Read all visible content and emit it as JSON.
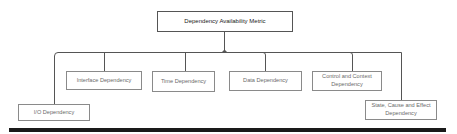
{
  "diagram": {
    "type": "hierarchy-tree",
    "root": {
      "id": "root",
      "label": "Dependency Availability Metric"
    },
    "children": [
      {
        "id": "io",
        "label": "I/O Dependency"
      },
      {
        "id": "interface",
        "label": "Interface Dependency"
      },
      {
        "id": "time",
        "label": "Time Dependency"
      },
      {
        "id": "data",
        "label": "Data Dependency"
      },
      {
        "id": "control",
        "label": "Control and Context Dependency"
      },
      {
        "id": "state",
        "label": "State, Cause and Effect Dependency"
      }
    ],
    "edges": [
      {
        "from": "root",
        "to": "io"
      },
      {
        "from": "root",
        "to": "interface"
      },
      {
        "from": "root",
        "to": "time"
      },
      {
        "from": "root",
        "to": "data"
      },
      {
        "from": "root",
        "to": "control"
      },
      {
        "from": "root",
        "to": "state"
      }
    ],
    "colors": {
      "line": "#555555",
      "box_border": "#8a8a8a",
      "root_border": "#555555",
      "text": "#6a6a6a",
      "root_text": "#222222",
      "bottom_bar": "#1a1a1a"
    }
  }
}
